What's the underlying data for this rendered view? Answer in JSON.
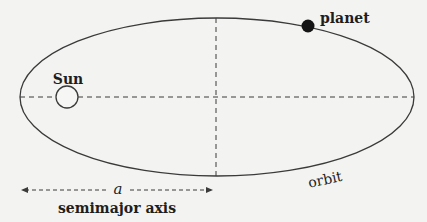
{
  "labels": {
    "sun": "Sun",
    "planet": "planet",
    "orbit": "orbit",
    "semimajor_symbol": "a",
    "semimajor_label": "semimajor axis"
  },
  "geometry": {
    "ellipse": {
      "cx": 217,
      "cy": 97,
      "rx": 197,
      "ry": 79
    },
    "sun": {
      "cx": 67,
      "cy": 97,
      "r": 11
    },
    "planet": {
      "cx": 308,
      "cy": 26,
      "r": 6
    },
    "semimajor_arrow": {
      "x1": 20,
      "x2": 214,
      "y": 190
    }
  },
  "colors": {
    "background": "#f3f3f1",
    "line": "#3a3a3a",
    "planet_fill": "#141414"
  }
}
